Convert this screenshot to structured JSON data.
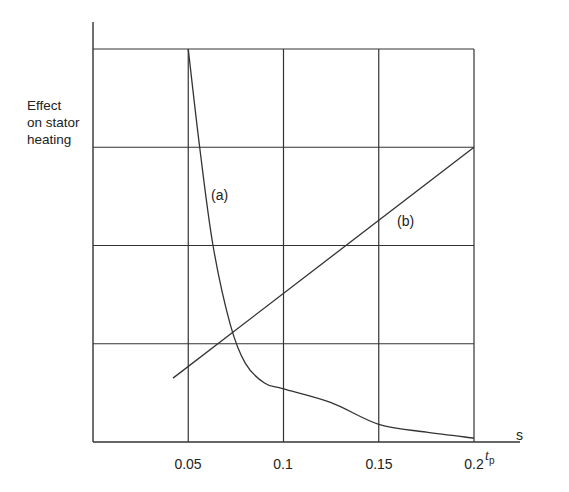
{
  "chart_data": {
    "type": "line",
    "title": "",
    "xlabel": "t_p",
    "xlabel_main": "t",
    "xlabel_sub": "p",
    "xunit": "s",
    "ylabel": "Effect on stator heating",
    "ylabel_lines": [
      "Effect",
      "on stator",
      "heating"
    ],
    "xlim": [
      0,
      0.2
    ],
    "ylim": [
      0,
      4
    ],
    "x_ticks": [
      0.05,
      0.1,
      0.15,
      0.2
    ],
    "x_tick_labels": [
      "0.05",
      "0.1",
      "0.15",
      "0.2"
    ],
    "y_ticks": [],
    "grid": true,
    "grid_x": [
      0.05,
      0.1,
      0.15,
      0.2
    ],
    "grid_y": [
      1,
      2,
      3,
      4
    ],
    "legend": null,
    "series": [
      {
        "name": "(a)",
        "label": "(a)",
        "style": "curve",
        "x": [
          0.05,
          0.056,
          0.063,
          0.072,
          0.08,
          0.09,
          0.1,
          0.125,
          0.15,
          0.175,
          0.2
        ],
        "y": [
          4.0,
          3.0,
          2.0,
          1.2,
          0.8,
          0.6,
          0.54,
          0.4,
          0.18,
          0.1,
          0.04
        ]
      },
      {
        "name": "(b)",
        "label": "(b)",
        "style": "straight",
        "x": [
          0.042,
          0.2
        ],
        "y": [
          0.65,
          3.0
        ]
      }
    ],
    "annotations": [
      {
        "text": "(a)",
        "x": 0.065,
        "y": 2.58
      },
      {
        "text": "(b)",
        "x": 0.16,
        "y": 2.2
      }
    ]
  }
}
